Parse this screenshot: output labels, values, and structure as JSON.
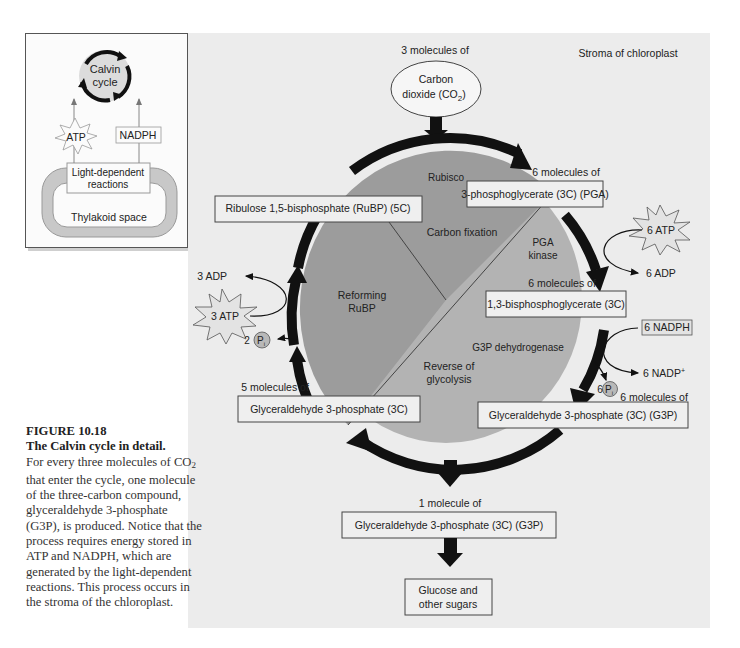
{
  "inset": {
    "cycle_label_line1": "Calvin",
    "cycle_label_line2": "cycle",
    "atp": "ATP",
    "nadph": "NADPH",
    "light_line1": "Light-dependent",
    "light_line2": "reactions",
    "thylakoid": "Thylakoid space"
  },
  "diagram": {
    "stroma_label": "Stroma of chloroplast",
    "co2_count": "3 molecules of",
    "co2_line1": "Carbon",
    "co2_line2": "dioxide (CO",
    "co2_sub": "2",
    "co2_close": ")",
    "rubp_count": "3 molecules of",
    "rubp_box": "Ribulose 1,5-bisphosphate (RuBP) (5C)",
    "pga_count": "6 molecules of",
    "pga_box": "3-phosphoglycerate (3C) (PGA)",
    "bpg_count": "6 molecules of",
    "bpg_box": "1,3-bisphosphoglycerate (3C)",
    "g3p6_count": "6 molecules of",
    "g3p6_box": "Glyceraldehyde 3-phosphate (3C) (G3P)",
    "g3p5_count": "5 molecules of",
    "g3p5_box": "Glyceraldehyde 3-phosphate (3C)",
    "g3p1_count": "1 molecule of",
    "g3p1_box": "Glyceraldehyde 3-phosphate (3C) (G3P)",
    "glucose_line1": "Glucose and",
    "glucose_line2": "other sugars",
    "sector_rubisco": "Rubisco",
    "sector_carbon_fixation": "Carbon fixation",
    "sector_pga_kinase_1": "PGA",
    "sector_pga_kinase_2": "kinase",
    "sector_reforming_1": "Reforming",
    "sector_reforming_2": "RuBP",
    "sector_g3p_dehydrogenase": "G3P dehydrogenase",
    "sector_reverse_1": "Reverse of",
    "sector_reverse_2": "glycolysis",
    "atp6": "6 ATP",
    "adp6": "6 ADP",
    "nadph6": "6 NADPH",
    "nadp6": "6 NADP",
    "nadp_sup": "+",
    "pi6_count": "6",
    "pi2_count": "2",
    "pi_label": "P",
    "pi_sub": "i",
    "atp3": "3 ATP",
    "adp3": "3 ADP"
  },
  "caption": {
    "figure_number": "FIGURE 10.18",
    "title": "The Calvin cycle in detail.",
    "body_1": "For every three molecules of",
    "body_co2": "CO",
    "body_co2_sub": "2",
    "body_2": " that enter the cycle, one molecule of the three-carbon compound, glyceraldehyde 3-phosphate (G3P), is produced. Notice that the process requires energy stored in ATP and NADPH, which are generated by the light-dependent reactions. This process occurs in the stroma of the chloroplast."
  },
  "colors": {
    "panel_bg": "#ececec",
    "sector_dark": "#9c9c9c",
    "sector_light": "#b3b3b3",
    "arrow": "#111111",
    "box_fill": "#f0f0f0",
    "inset_thylakoid": "#c8c8c8",
    "inset_cycle_fill": "#dcdcdc"
  }
}
